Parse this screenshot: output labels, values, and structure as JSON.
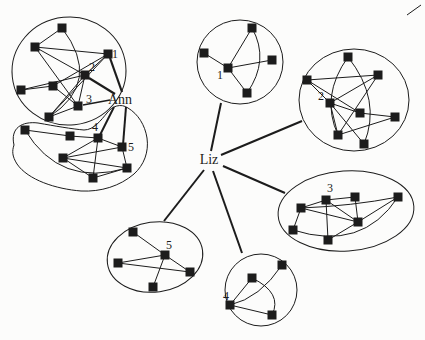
{
  "figure": {
    "type": "sociogram-network-diagram",
    "background": "#fcfcfb",
    "ink": "#1c1c1c",
    "canvas": {
      "width": 425,
      "height": 340
    },
    "node_size": 9,
    "edge_width": 1,
    "people": [
      {
        "id": "ann",
        "name": "Ann",
        "x": 120,
        "y": 104,
        "font_size": 14
      },
      {
        "id": "liz",
        "name": "Liz",
        "x": 209,
        "y": 164,
        "font_size": 14
      }
    ],
    "person_links": [
      {
        "person": "ann",
        "to_group": "ann-group-a",
        "to_label": "1",
        "x1": 122,
        "y1": 92,
        "x2": 110,
        "y2": 58,
        "w": 2.2
      },
      {
        "person": "ann",
        "to_group": "ann-group-a",
        "to_label": "2",
        "x1": 115,
        "y1": 94,
        "x2": 89,
        "y2": 78,
        "w": 2.2
      },
      {
        "person": "ann",
        "to_group": "ann-group-a",
        "to_label": "3",
        "x1": 110,
        "y1": 100,
        "x2": 83,
        "y2": 105,
        "w": 1.6
      },
      {
        "person": "ann",
        "to_group": "ann-group-b",
        "to_label": "4",
        "x1": 114,
        "y1": 107,
        "x2": 100,
        "y2": 135,
        "w": 2.0
      },
      {
        "person": "ann",
        "to_group": "ann-group-b",
        "to_label": "5",
        "x1": 126,
        "y1": 107,
        "x2": 123,
        "y2": 145,
        "w": 2.0
      },
      {
        "person": "liz",
        "to_group": "liz-group-1",
        "to_label": "1",
        "x1": 211,
        "y1": 151,
        "x2": 221,
        "y2": 103,
        "w": 2.0
      },
      {
        "person": "liz",
        "to_group": "liz-group-2",
        "to_label": "2",
        "x1": 221,
        "y1": 155,
        "x2": 302,
        "y2": 121,
        "w": 2.0
      },
      {
        "person": "liz",
        "to_group": "liz-group-3",
        "to_label": "3",
        "x1": 223,
        "y1": 166,
        "x2": 285,
        "y2": 193,
        "w": 2.0
      },
      {
        "person": "liz",
        "to_group": "liz-group-4",
        "to_label": "4",
        "x1": 213,
        "y1": 171,
        "x2": 242,
        "y2": 253,
        "w": 2.0
      },
      {
        "person": "liz",
        "to_group": "liz-group-5",
        "to_label": "5",
        "x1": 204,
        "y1": 170,
        "x2": 164,
        "y2": 221,
        "w": 2.0
      }
    ],
    "clusters": [
      {
        "id": "ann-group-a",
        "outline": {
          "kind": "ellipse",
          "cx": 69,
          "cy": 71,
          "rx": 57,
          "ry": 54,
          "rotate": -6
        },
        "nodes": [
          {
            "x": 62,
            "y": 28
          },
          {
            "x": 35,
            "y": 47
          },
          {
            "x": 108,
            "y": 54,
            "label": "1",
            "lx": 115,
            "ly": 58
          },
          {
            "x": 85,
            "y": 75,
            "label": "2",
            "lx": 92,
            "ly": 71
          },
          {
            "x": 21,
            "y": 90
          },
          {
            "x": 53,
            "y": 86
          },
          {
            "x": 78,
            "y": 106,
            "label": "3",
            "lx": 89,
            "ly": 103
          },
          {
            "x": 49,
            "y": 117
          }
        ],
        "edges": [
          [
            0,
            1
          ],
          [
            0,
            7,
            {
              "cx": 103,
              "cy": 82
            }
          ],
          [
            1,
            2
          ],
          [
            1,
            3
          ],
          [
            1,
            6
          ],
          [
            2,
            3
          ],
          [
            2,
            5
          ],
          [
            2,
            7
          ],
          [
            3,
            4
          ],
          [
            3,
            6
          ],
          [
            3,
            7
          ],
          [
            4,
            5
          ],
          [
            5,
            6
          ],
          [
            6,
            7
          ]
        ]
      },
      {
        "id": "ann-group-b",
        "outline": {
          "kind": "path",
          "d": "M 14,145 C 10,128 22,121 38,123 C 55,126 72,129 84,130 C 94,130 101,120 107,113 C 112,106 121,103 128,108 C 138,114 145,125 147,138 C 149,152 144,165 134,174 C 120,186 101,192 81,191 C 56,189 28,180 17,164 C 12,156 12,151 14,145 Z"
        },
        "nodes": [
          {
            "x": 25,
            "y": 130
          },
          {
            "x": 70,
            "y": 136
          },
          {
            "x": 98,
            "y": 138,
            "label": "4",
            "lx": 95,
            "ly": 131
          },
          {
            "x": 122,
            "y": 147,
            "label": "5",
            "lx": 131,
            "ly": 151
          },
          {
            "x": 63,
            "y": 158
          },
          {
            "x": 127,
            "y": 168
          },
          {
            "x": 93,
            "y": 178
          }
        ],
        "edges": [
          [
            0,
            1
          ],
          [
            0,
            5,
            {
              "cx": 60,
              "cy": 188
            }
          ],
          [
            1,
            2
          ],
          [
            2,
            3
          ],
          [
            2,
            4
          ],
          [
            2,
            6
          ],
          [
            3,
            4
          ],
          [
            3,
            5
          ],
          [
            4,
            6
          ],
          [
            4,
            5
          ],
          [
            6,
            5
          ]
        ]
      },
      {
        "id": "liz-group-1",
        "outline": {
          "kind": "ellipse",
          "cx": 240,
          "cy": 62,
          "rx": 43,
          "ry": 42,
          "rotate": 0
        },
        "nodes": [
          {
            "x": 252,
            "y": 28
          },
          {
            "x": 204,
            "y": 53
          },
          {
            "x": 228,
            "y": 68,
            "label": "1",
            "lx": 220,
            "ly": 79
          },
          {
            "x": 272,
            "y": 60
          },
          {
            "x": 247,
            "y": 93
          }
        ],
        "edges": [
          [
            2,
            0
          ],
          [
            2,
            1
          ],
          [
            2,
            3
          ],
          [
            2,
            4
          ],
          [
            0,
            4,
            {
              "cx": 270,
              "cy": 60
            }
          ]
        ]
      },
      {
        "id": "liz-group-2",
        "outline": {
          "kind": "ellipse",
          "cx": 354,
          "cy": 100,
          "rx": 55,
          "ry": 51,
          "rotate": 0
        },
        "nodes": [
          {
            "x": 348,
            "y": 57
          },
          {
            "x": 307,
            "y": 80
          },
          {
            "x": 378,
            "y": 75
          },
          {
            "x": 330,
            "y": 103,
            "label": "2",
            "lx": 321,
            "ly": 100
          },
          {
            "x": 360,
            "y": 113
          },
          {
            "x": 395,
            "y": 117
          },
          {
            "x": 338,
            "y": 135
          },
          {
            "x": 364,
            "y": 144
          }
        ],
        "edges": [
          [
            1,
            2
          ],
          [
            1,
            3
          ],
          [
            1,
            4
          ],
          [
            3,
            2
          ],
          [
            3,
            4
          ],
          [
            3,
            6
          ],
          [
            3,
            7
          ],
          [
            4,
            5
          ],
          [
            2,
            6
          ],
          [
            6,
            5
          ],
          [
            0,
            6,
            {
              "cx": 320,
              "cy": 96
            }
          ],
          [
            0,
            7,
            {
              "cx": 382,
              "cy": 100
            }
          ]
        ]
      },
      {
        "id": "liz-group-3",
        "outline": {
          "kind": "ellipse",
          "cx": 346,
          "cy": 211,
          "rx": 68,
          "ry": 40,
          "rotate": -4
        },
        "nodes": [
          {
            "x": 326,
            "y": 200,
            "label": "3",
            "lx": 330,
            "ly": 192
          },
          {
            "x": 355,
            "y": 197
          },
          {
            "x": 398,
            "y": 197
          },
          {
            "x": 301,
            "y": 208
          },
          {
            "x": 358,
            "y": 222
          },
          {
            "x": 293,
            "y": 230
          },
          {
            "x": 328,
            "y": 240
          }
        ],
        "edges": [
          [
            0,
            1
          ],
          [
            0,
            3
          ],
          [
            0,
            4
          ],
          [
            0,
            6
          ],
          [
            3,
            5
          ],
          [
            3,
            4
          ],
          [
            1,
            4
          ],
          [
            2,
            4
          ],
          [
            2,
            3,
            {
              "cx": 352,
              "cy": 206
            }
          ],
          [
            2,
            5,
            {
              "cx": 362,
              "cy": 252
            }
          ],
          [
            6,
            4
          ]
        ]
      },
      {
        "id": "liz-group-4",
        "outline": {
          "kind": "ellipse",
          "cx": 261,
          "cy": 290,
          "rx": 36,
          "ry": 36,
          "rotate": 0
        },
        "nodes": [
          {
            "x": 282,
            "y": 265
          },
          {
            "x": 252,
            "y": 278
          },
          {
            "x": 230,
            "y": 305,
            "label": "4",
            "lx": 226,
            "ly": 300
          },
          {
            "x": 272,
            "y": 315
          }
        ],
        "edges": [
          [
            2,
            1
          ],
          [
            2,
            3
          ],
          [
            2,
            0,
            {
              "cx": 260,
              "cy": 298
            }
          ],
          [
            1,
            3,
            {
              "cx": 283,
              "cy": 293
            }
          ]
        ]
      },
      {
        "id": "liz-group-5",
        "outline": {
          "kind": "ellipse",
          "cx": 155,
          "cy": 257,
          "rx": 48,
          "ry": 35,
          "rotate": -8
        },
        "nodes": [
          {
            "x": 133,
            "y": 232
          },
          {
            "x": 165,
            "y": 255,
            "label": "5",
            "lx": 169,
            "ly": 249
          },
          {
            "x": 118,
            "y": 263
          },
          {
            "x": 190,
            "y": 272
          },
          {
            "x": 153,
            "y": 287
          }
        ],
        "edges": [
          [
            1,
            0
          ],
          [
            1,
            2
          ],
          [
            1,
            3
          ],
          [
            1,
            4
          ],
          [
            2,
            3
          ]
        ]
      }
    ],
    "stray_marks": [
      {
        "x1": 407,
        "y1": 15,
        "x2": 421,
        "y2": 5
      }
    ]
  }
}
